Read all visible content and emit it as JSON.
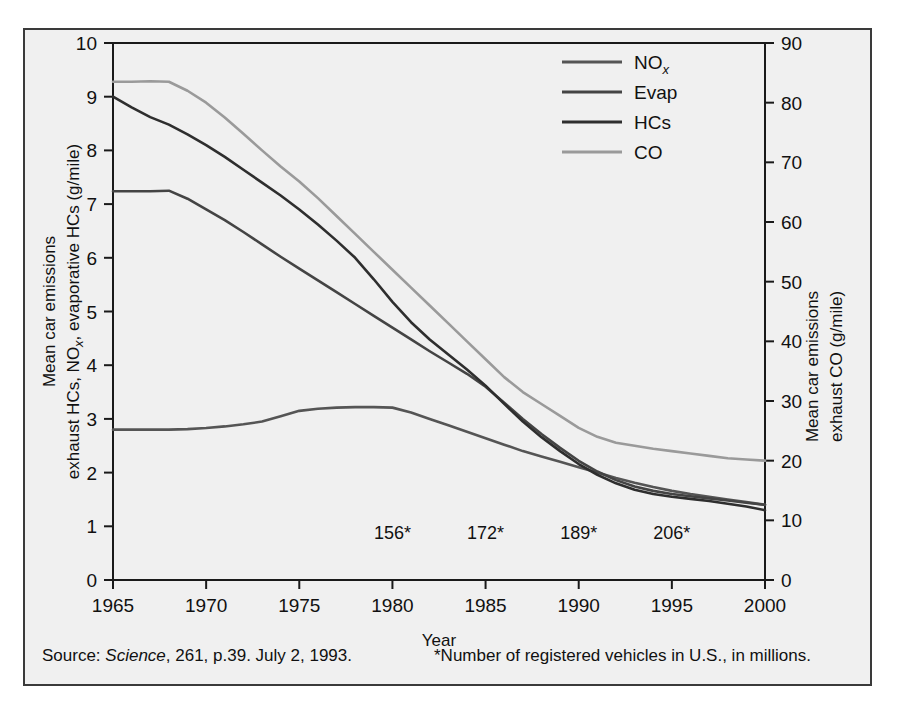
{
  "figure": {
    "background_color": "#f0f0f0",
    "border_color": "#3a3a3a"
  },
  "footer": {
    "source_prefix": "Source: ",
    "source_italic": "Science",
    "source_rest": ", 261, p.39. July 2, 1993.",
    "footnote": "*Number of registered vehicles in U.S., in millions."
  },
  "chart_data": {
    "type": "line",
    "title": "",
    "xlabel": "Year",
    "ylabel_left_line1": "Mean car emissions",
    "ylabel_left_line2": "exhaust HCs, NO",
    "ylabel_left_sub": "x",
    "ylabel_left_line2b": ", evaporative HCs (g/mile)",
    "ylabel_right_line1": "Mean car emissions",
    "ylabel_right_line2": "exhaust CO (g/mile)",
    "xlim": [
      1965,
      2000
    ],
    "ylim_left": [
      0,
      10
    ],
    "ylim_right": [
      0,
      90
    ],
    "xticks": [
      1965,
      1970,
      1975,
      1980,
      1985,
      1990,
      1995,
      2000
    ],
    "xtick_labels": [
      "1965",
      "1970",
      "1975",
      "1980",
      "1985",
      "1990",
      "1995",
      "2000"
    ],
    "yticks_left": [
      0,
      1,
      2,
      3,
      4,
      5,
      6,
      7,
      8,
      9,
      10
    ],
    "ytick_labels_left": [
      "0",
      "1",
      "2",
      "3",
      "4",
      "5",
      "6",
      "7",
      "8",
      "9",
      "10"
    ],
    "yticks_right": [
      0,
      10,
      20,
      30,
      40,
      50,
      60,
      70,
      80,
      90
    ],
    "ytick_labels_right": [
      "0",
      "10",
      "20",
      "30",
      "40",
      "50",
      "60",
      "70",
      "80",
      "90"
    ],
    "grid": false,
    "legend_position": "top-right",
    "x": [
      1965,
      1966,
      1967,
      1968,
      1969,
      1970,
      1971,
      1972,
      1973,
      1974,
      1975,
      1976,
      1977,
      1978,
      1979,
      1980,
      1981,
      1982,
      1983,
      1984,
      1985,
      1986,
      1987,
      1988,
      1989,
      1990,
      1991,
      1992,
      1993,
      1994,
      1995,
      1996,
      1997,
      1998,
      1999,
      2000
    ],
    "series": [
      {
        "name": "NO",
        "name_sub": "x",
        "label": "NOx",
        "color": "#555555",
        "axis": "left",
        "values": [
          2.8,
          2.8,
          2.8,
          2.8,
          2.81,
          2.83,
          2.86,
          2.9,
          2.95,
          3.05,
          3.15,
          3.19,
          3.21,
          3.22,
          3.22,
          3.21,
          3.12,
          3.0,
          2.88,
          2.76,
          2.64,
          2.52,
          2.4,
          2.3,
          2.2,
          2.1,
          2.0,
          1.9,
          1.81,
          1.73,
          1.66,
          1.6,
          1.55,
          1.5,
          1.45,
          1.4
        ]
      },
      {
        "name": "Evap",
        "label": "Evap",
        "color": "#444444",
        "axis": "left",
        "values": [
          7.24,
          7.24,
          7.24,
          7.25,
          7.1,
          6.9,
          6.7,
          6.48,
          6.25,
          6.02,
          5.8,
          5.58,
          5.36,
          5.14,
          4.92,
          4.7,
          4.48,
          4.26,
          4.05,
          3.84,
          3.6,
          3.3,
          3.0,
          2.72,
          2.46,
          2.22,
          2.02,
          1.86,
          1.74,
          1.66,
          1.6,
          1.56,
          1.52,
          1.48,
          1.44,
          1.4
        ]
      },
      {
        "name": "HCs",
        "label": "HCs",
        "color": "#2e2e2e",
        "axis": "left",
        "values": [
          9.0,
          8.8,
          8.62,
          8.48,
          8.3,
          8.1,
          7.88,
          7.64,
          7.4,
          7.16,
          6.9,
          6.62,
          6.32,
          6.0,
          5.6,
          5.18,
          4.8,
          4.48,
          4.2,
          3.92,
          3.62,
          3.28,
          2.95,
          2.66,
          2.4,
          2.16,
          1.96,
          1.8,
          1.68,
          1.6,
          1.55,
          1.51,
          1.47,
          1.42,
          1.37,
          1.3
        ]
      },
      {
        "name": "CO",
        "label": "CO",
        "color": "#9a9a9a",
        "axis": "right",
        "values": [
          83.5,
          83.5,
          83.6,
          83.5,
          82.0,
          80.0,
          77.5,
          74.8,
          72.0,
          69.3,
          66.8,
          64.0,
          61.0,
          58.0,
          55.0,
          52.0,
          49.0,
          46.0,
          43.0,
          40.0,
          37.0,
          34.0,
          31.5,
          29.5,
          27.5,
          25.5,
          24.0,
          23.0,
          22.5,
          22.0,
          21.6,
          21.2,
          20.8,
          20.4,
          20.2,
          20.0
        ]
      }
    ],
    "annotations": [
      {
        "text": "156*",
        "x": 1980
      },
      {
        "text": "172*",
        "x": 1985
      },
      {
        "text": "189*",
        "x": 1990
      },
      {
        "text": "206*",
        "x": 1995
      }
    ],
    "legend_entries": [
      "NOx",
      "Evap",
      "HCs",
      "CO"
    ]
  }
}
